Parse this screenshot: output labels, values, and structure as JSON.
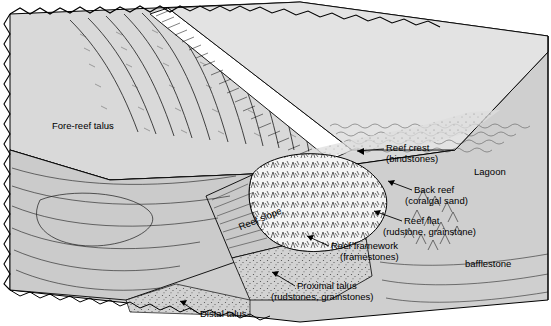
{
  "figure": {
    "type": "block-diagram",
    "palette": {
      "background": "#ffffff",
      "block_top": "#d8d8d8",
      "block_front": "#cfcfcf",
      "block_side": "#c4c4c4",
      "reef_framework": "#f2f2f2",
      "reef_crest_highlight": "#ffffff",
      "lagoon": "#e6e6e6",
      "outline": "#000000"
    },
    "labels": [
      {
        "id": "fore-reef-talus",
        "text": "Fore-reef talus",
        "x": 52,
        "y": 120,
        "align": "left"
      },
      {
        "id": "reef-crest",
        "text": "Reef crest",
        "x": 386,
        "y": 145,
        "align": "left"
      },
      {
        "id": "reef-crest-sub",
        "text": "(bindstones)",
        "x": 386,
        "y": 156,
        "align": "left"
      },
      {
        "id": "lagoon",
        "text": "Lagoon",
        "x": 474,
        "y": 169,
        "align": "left"
      },
      {
        "id": "back-reef",
        "text": "Back reef",
        "x": 414,
        "y": 187,
        "align": "left"
      },
      {
        "id": "back-reef-sub",
        "text": "(coralgal sand)",
        "x": 405,
        "y": 198,
        "align": "left"
      },
      {
        "id": "reef-flat",
        "text": "Reef flat",
        "x": 404,
        "y": 218,
        "align": "left"
      },
      {
        "id": "reef-flat-sub",
        "text": "(rudstone, grainstone)",
        "x": 383,
        "y": 229,
        "align": "left"
      },
      {
        "id": "reef-slope",
        "text": "Reef slope",
        "x": 237,
        "y": 228,
        "align": "left",
        "rotate": -22
      },
      {
        "id": "reef-framework",
        "text": "Reef framework",
        "x": 331,
        "y": 243,
        "align": "left"
      },
      {
        "id": "reef-framework-sub",
        "text": "(framestones)",
        "x": 340,
        "y": 254,
        "align": "left"
      },
      {
        "id": "bafflestone",
        "text": "bafflestone",
        "x": 465,
        "y": 261,
        "align": "left"
      },
      {
        "id": "proximal-talus",
        "text": "Proximal talus",
        "x": 297,
        "y": 283,
        "align": "left"
      },
      {
        "id": "proximal-talus-sub",
        "text": "(rudstones, grainstones)",
        "x": 271,
        "y": 294,
        "align": "left"
      },
      {
        "id": "distal-talus",
        "text": "Distal talus",
        "x": 200,
        "y": 311,
        "align": "left"
      }
    ],
    "leaders": [
      {
        "id": "leader-reef-crest",
        "from": [
          384,
          149
        ],
        "to": [
          355,
          152
        ]
      },
      {
        "id": "leader-back-reef",
        "from": [
          412,
          190
        ],
        "to": [
          386,
          182
        ]
      },
      {
        "id": "leader-reef-flat",
        "from": [
          402,
          221
        ],
        "to": [
          372,
          212
        ]
      },
      {
        "id": "leader-reef-framework",
        "from": [
          329,
          246
        ],
        "to": [
          305,
          235
        ]
      },
      {
        "id": "leader-proximal",
        "from": [
          295,
          286
        ],
        "to": [
          270,
          272
        ]
      },
      {
        "id": "leader-distal",
        "from": [
          198,
          313
        ],
        "to": [
          178,
          300
        ]
      }
    ]
  }
}
